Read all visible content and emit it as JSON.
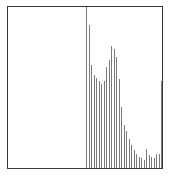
{
  "chart_data": {
    "type": "bar",
    "title": "",
    "xlabel": "",
    "ylabel": "",
    "grid": false,
    "legend": null,
    "ylim": [
      0,
      100
    ],
    "categories": [
      1,
      2,
      3,
      4,
      5,
      6,
      7,
      8,
      9,
      10,
      11,
      12,
      13,
      14,
      15,
      16,
      17,
      18,
      19,
      20,
      21,
      22,
      23,
      24,
      25,
      26,
      27,
      28,
      29,
      30,
      31
    ],
    "values": [
      100,
      89,
      64,
      58,
      56,
      54,
      52,
      54,
      63,
      67,
      76,
      74,
      69,
      55,
      38,
      27,
      23,
      18,
      14,
      11,
      9,
      7,
      6,
      5,
      12,
      8,
      7,
      6,
      9,
      9,
      54
    ],
    "colors": {
      "frame": "#3a3a3a",
      "bar": "#7a7a7a",
      "background": "#ffffff"
    }
  }
}
